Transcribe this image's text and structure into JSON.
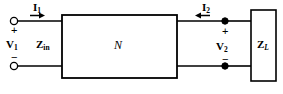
{
  "diagram": {
    "type": "circuit-schematic",
    "colors": {
      "line": "#000000",
      "background": "#ffffff",
      "text": "#000000"
    },
    "labels": {
      "current_1": "I",
      "current_1_sub": "1",
      "current_2": "I",
      "current_2_sub": "2",
      "voltage_1": "V",
      "voltage_1_sub": "1",
      "voltage_2": "V",
      "voltage_2_sub": "2",
      "z_in": "Z",
      "z_in_sub": "in",
      "z_load": "Z",
      "z_load_sub": "L",
      "network": "N",
      "plus_left": "+",
      "minus_left": "−",
      "plus_right": "+",
      "minus_right": "−"
    },
    "elements": {
      "network_box": "N",
      "load_box": "Z_L",
      "terminal_left_top": "open-circle",
      "terminal_left_bottom": "open-circle",
      "terminal_right_top": "filled-dot",
      "terminal_right_bottom": "filled-dot",
      "arrow_1_direction": "right",
      "arrow_2_direction": "left"
    }
  }
}
